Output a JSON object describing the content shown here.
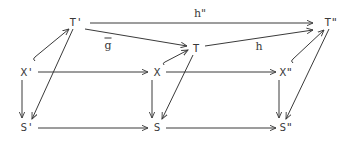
{
  "diagram": {
    "type": "commutative-diagram",
    "nodes": [
      {
        "id": "Tp",
        "label": "T'",
        "x": 76,
        "y": 22
      },
      {
        "id": "T",
        "label": "T",
        "x": 196,
        "y": 48
      },
      {
        "id": "Tpp",
        "label": "T\"",
        "x": 331,
        "y": 22
      },
      {
        "id": "Xp",
        "label": "X'",
        "x": 27,
        "y": 72
      },
      {
        "id": "X",
        "label": "X",
        "x": 157,
        "y": 72
      },
      {
        "id": "Xpp",
        "label": "X\"",
        "x": 286,
        "y": 72
      },
      {
        "id": "Sp",
        "label": "S'",
        "x": 27,
        "y": 127
      },
      {
        "id": "S",
        "label": "S",
        "x": 157,
        "y": 127
      },
      {
        "id": "Spp",
        "label": "S\"",
        "x": 286,
        "y": 127
      }
    ],
    "edge_labels": [
      {
        "id": "h2",
        "text": "h\"",
        "x": 200,
        "y": 13
      },
      {
        "id": "gbar",
        "text": "g",
        "overline": true,
        "x": 108,
        "y": 45
      },
      {
        "id": "h",
        "text": "h",
        "x": 259,
        "y": 46
      }
    ],
    "edges": [
      {
        "from": "Tp",
        "to": "Tpp",
        "label": "h\""
      },
      {
        "from": "Tp",
        "to": "T",
        "label": "g-bar"
      },
      {
        "from": "T",
        "to": "Tpp",
        "label": "h"
      },
      {
        "from": "Xp",
        "to": "Tp",
        "style": "hook"
      },
      {
        "from": "X",
        "to": "T",
        "style": "hook"
      },
      {
        "from": "Xpp",
        "to": "Tpp",
        "style": "hook"
      },
      {
        "from": "Xp",
        "to": "X"
      },
      {
        "from": "X",
        "to": "Xpp"
      },
      {
        "from": "Xp",
        "to": "Sp"
      },
      {
        "from": "X",
        "to": "S"
      },
      {
        "from": "Xpp",
        "to": "Spp"
      },
      {
        "from": "Tp",
        "to": "Sp"
      },
      {
        "from": "T",
        "to": "S"
      },
      {
        "from": "Tpp",
        "to": "Spp"
      },
      {
        "from": "Sp",
        "to": "S"
      },
      {
        "from": "S",
        "to": "Spp"
      }
    ],
    "colors": {
      "ink": "#3a3a3a",
      "background": "#ffffff"
    }
  }
}
